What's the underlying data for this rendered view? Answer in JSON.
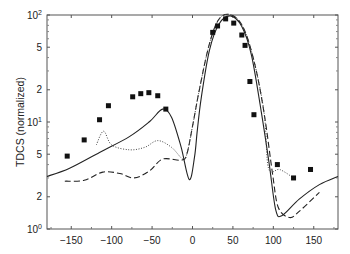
{
  "chart_data": {
    "type": "line",
    "title": "",
    "xlabel": "",
    "ylabel": "TDCS (normalized)",
    "xlim": [
      -180,
      180
    ],
    "ylim": [
      1,
      100
    ],
    "yscale": "log",
    "grid": false,
    "legend": null,
    "x_ticks": [
      -150,
      -100,
      -50,
      0,
      50,
      100,
      150
    ],
    "x_tick_labels": [
      "−150",
      "−100",
      "−50",
      "0",
      "50",
      "100",
      "150"
    ],
    "y_ticks": [
      {
        "value": 1,
        "label": "10",
        "exp": "0"
      },
      {
        "value": 2,
        "label": "2",
        "exp": ""
      },
      {
        "value": 5,
        "label": "5",
        "exp": ""
      },
      {
        "value": 10,
        "label": "10",
        "exp": "1"
      },
      {
        "value": 20,
        "label": "2",
        "exp": ""
      },
      {
        "value": 50,
        "label": "5",
        "exp": ""
      },
      {
        "value": 100,
        "label": "10",
        "exp": "2"
      }
    ],
    "series": [
      {
        "name": "solid",
        "style": "solid",
        "x": [
          -180,
          -152,
          -115,
          -78,
          -53,
          -37,
          -26,
          -14,
          -4,
          2.5,
          6,
          11,
          21,
          33,
          47,
          61,
          73,
          85,
          95,
          103,
          111,
          132,
          157,
          180
        ],
        "y": [
          3.1,
          3.7,
          5.2,
          7.3,
          10.1,
          13.2,
          11.1,
          5.8,
          2.9,
          4.7,
          8.5,
          17.2,
          47,
          83,
          98,
          78,
          42,
          12.6,
          4.0,
          1.5,
          1.34,
          1.9,
          2.6,
          3.1
        ]
      },
      {
        "name": "dashed",
        "style": "dashed",
        "x": [
          -158,
          -134,
          -111,
          -90,
          -72,
          -53,
          -37,
          -14,
          -7,
          0,
          9,
          21,
          33,
          48,
          63,
          77,
          89,
          99,
          106,
          120,
          132,
          157
        ],
        "y": [
          2.8,
          2.85,
          3.4,
          3.3,
          3.0,
          3.5,
          4.5,
          4.4,
          5.0,
          9.1,
          21,
          54,
          92,
          100,
          76,
          35,
          11.6,
          3.3,
          1.6,
          1.28,
          1.46,
          2.2
        ]
      },
      {
        "name": "dotted",
        "style": "dotted",
        "x": [
          -119,
          -110,
          -100,
          -78,
          -59,
          -43,
          -26,
          -12,
          -7,
          0,
          9,
          21,
          33,
          48,
          63,
          77,
          89,
          94,
          108,
          125
        ],
        "y": [
          6.1,
          8.2,
          6.1,
          5.5,
          5.8,
          6.7,
          5.8,
          4.5,
          5.0,
          9.1,
          21,
          54,
          92,
          100,
          76,
          35,
          11.6,
          3.7,
          3.6,
          3.0
        ]
      },
      {
        "name": "experiment",
        "style": "markers-square",
        "x": [
          -155,
          -134,
          -115,
          -104,
          -74,
          -64,
          -54,
          -43,
          -33,
          25,
          31,
          41,
          51,
          61,
          65,
          71,
          76,
          105,
          125,
          146
        ],
        "y": [
          4.8,
          6.8,
          10.5,
          14.2,
          17.2,
          18.4,
          18.8,
          17.6,
          13.2,
          68.8,
          79,
          92,
          84,
          65,
          52,
          23.9,
          11.7,
          4.0,
          3.0,
          3.6
        ]
      }
    ]
  }
}
